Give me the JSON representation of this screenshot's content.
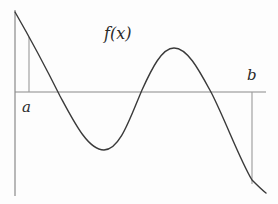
{
  "figure": {
    "labels": {
      "function": "f(x)",
      "left_bound": "a",
      "right_bound": "b"
    },
    "colors": {
      "curve": "#3a3a3a",
      "axis": "#8a8a8a",
      "bound_lines": "#9a9a9a",
      "text": "#2a2a2a",
      "background": "#fdfdfd"
    },
    "geometry": {
      "y_axis": {
        "x": 15,
        "y1": 10,
        "y2": 196
      },
      "x_axis": {
        "y": 92,
        "x1": 15,
        "x2": 266
      },
      "line_a": {
        "x": 29,
        "y1": 37,
        "y2": 92
      },
      "line_b": {
        "x": 252,
        "y1": 92,
        "y2": 184
      },
      "curve_path": "M15,12 C30,38 48,72 60,96 C74,122 88,150 104,150 C120,150 130,118 142,90 C152,68 162,48 174,48 C188,48 200,72 212,94 C226,122 240,160 252,180 C258,186 262,190 266,193"
    },
    "key_points": {
      "start": [
        15,
        12
      ],
      "first_root_x": 58,
      "local_min": [
        104,
        150
      ],
      "second_root_x": 140,
      "local_max": [
        174,
        48
      ],
      "third_root_x": 212,
      "end": [
        266,
        193
      ]
    }
  }
}
